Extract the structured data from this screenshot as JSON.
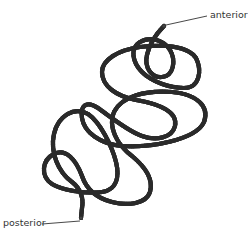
{
  "figure": {
    "labels": {
      "anterior": "anterior",
      "posterior": "posterior"
    },
    "colors": {
      "outline": "#2a2a2a",
      "body": "#e8e8e8",
      "text": "#333333",
      "background": "#ffffff"
    }
  }
}
